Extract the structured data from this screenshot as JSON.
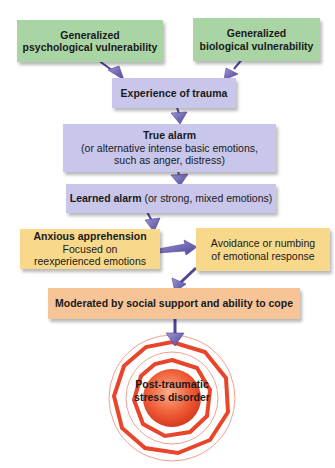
{
  "diagram": {
    "type": "flowchart",
    "nodes": {
      "psych_vuln": {
        "title": "Generalized",
        "subtitle": "psychological vulnerability",
        "color": "#a9d4a4"
      },
      "bio_vuln": {
        "title": "Generalized",
        "subtitle": "biological vulnerability",
        "color": "#a9d4a4"
      },
      "trauma": {
        "title": "Experience of trauma",
        "color": "#c8c6ea"
      },
      "true_alarm": {
        "title": "True alarm",
        "line2": "(or alternative intense basic emotions,",
        "line3": "such as anger, distress)",
        "color": "#c8c6ea"
      },
      "learned_alarm": {
        "title": "Learned alarm",
        "detail": " (or strong, mixed emotions)",
        "color": "#c8c6ea"
      },
      "anxious": {
        "title": "Anxious apprehension",
        "line2": "Focused on",
        "line3": "reexperienced emotions",
        "color": "#f8d88a"
      },
      "avoidance": {
        "line1": "Avoidance or numbing",
        "line2": "of emotional response",
        "color": "#f8d88a"
      },
      "moderated": {
        "title": "Moderated by social support and ability to cope",
        "color": "#f6c496"
      },
      "ptsd": {
        "line1": "Post-traumatic",
        "line2": "stress disorder",
        "color": "#e8452a"
      }
    },
    "edges": [
      [
        "psych_vuln",
        "trauma"
      ],
      [
        "bio_vuln",
        "trauma"
      ],
      [
        "trauma",
        "true_alarm"
      ],
      [
        "true_alarm",
        "learned_alarm"
      ],
      [
        "learned_alarm",
        "anxious"
      ],
      [
        "anxious",
        "avoidance"
      ],
      [
        "avoidance",
        "moderated"
      ],
      [
        "moderated",
        "ptsd"
      ]
    ],
    "arrow_color": "#6a5fb5"
  }
}
